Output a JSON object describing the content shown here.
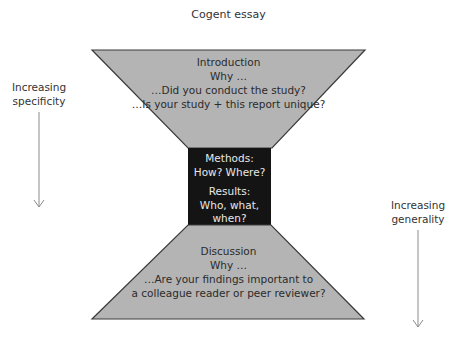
{
  "title": "Cogent essay",
  "colors": {
    "trapezoid_fill": "#b4b4b4",
    "trapezoid_stroke": "#3a3a3a",
    "middle_box_fill": "#141414",
    "middle_box_text": "#e8e8e8",
    "arrow": "#8c8c8c"
  },
  "introduction": {
    "heading": "Introduction",
    "why": "Why …",
    "lines": [
      "…Did you conduct the study?",
      "…Is your study + this report unique?"
    ]
  },
  "middle": {
    "methods_heading": "Methods:",
    "methods_text": "How? Where?",
    "results_heading": "Results:",
    "results_lines": [
      "Who, what,",
      "when?"
    ]
  },
  "discussion": {
    "heading": "Discussion",
    "why": "Why …",
    "lines": [
      "…Are your findings important to",
      "a colleague reader or peer reviewer?"
    ]
  },
  "left_annotation": {
    "lines": [
      "Increasing",
      "specificity"
    ],
    "arrow": "down-arrow"
  },
  "right_annotation": {
    "lines": [
      "Increasing",
      "generality"
    ],
    "arrow": "down-arrow"
  }
}
